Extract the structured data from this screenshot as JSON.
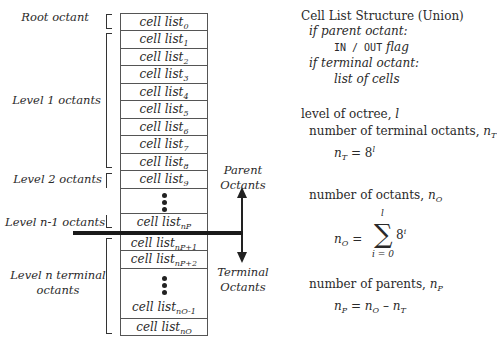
{
  "left_labels": {
    "root": "Root octant",
    "level1": "Level 1 octants",
    "level2": "Level 2 octants",
    "level_n1": "Level n-1 octants",
    "level_n_line1": "Level n terminal",
    "level_n_line2": "octants"
  },
  "cell_lists": [
    {
      "base": "cell list",
      "sub": "0"
    },
    {
      "base": "cell list",
      "sub": "1"
    },
    {
      "base": "cell list",
      "sub": "2"
    },
    {
      "base": "cell list",
      "sub": "3"
    },
    {
      "base": "cell list",
      "sub": "4"
    },
    {
      "base": "cell list",
      "sub": "5"
    },
    {
      "base": "cell list",
      "sub": "6"
    },
    {
      "base": "cell list",
      "sub": "7"
    },
    {
      "base": "cell list",
      "sub": "8"
    },
    {
      "base": "cell list",
      "sub": "9"
    },
    {
      "base": "cell list",
      "sub": "nP"
    },
    {
      "base": "cell list",
      "sub": "nP+1"
    },
    {
      "base": "cell list",
      "sub": "nP+2"
    },
    {
      "base": "cell list",
      "sub": "nO-1"
    },
    {
      "base": "cell list",
      "sub": "nO"
    }
  ],
  "arrows": {
    "parent_line1": "Parent",
    "parent_line2": "Octants",
    "terminal_line1": "Terminal",
    "terminal_line2": "Octants"
  },
  "structure": {
    "title": "Cell List Structure (Union)",
    "if_parent": "if parent octant:",
    "flag_mono": "IN / OUT",
    "flag_word": "flag",
    "if_terminal": "if terminal octant:",
    "list_of_cells": "list of cells"
  },
  "formulas": {
    "level_text": "level of octree, ",
    "level_var": "l",
    "num_terminal_text": "number of terminal octants, ",
    "nT_var": "n",
    "nT_sub": "T",
    "nT_eq_rhs_base": "8",
    "nT_eq_rhs_exp": "l",
    "num_octants_text": "number of octants, ",
    "nO_sub": "O",
    "sum_upper": "l",
    "sum_lower": "i = 0",
    "sum_term_base": "8",
    "sum_term_exp": "i",
    "num_parents_text": "number of parents, ",
    "nP_sub": "P",
    "equals": "=",
    "minus": "–"
  }
}
